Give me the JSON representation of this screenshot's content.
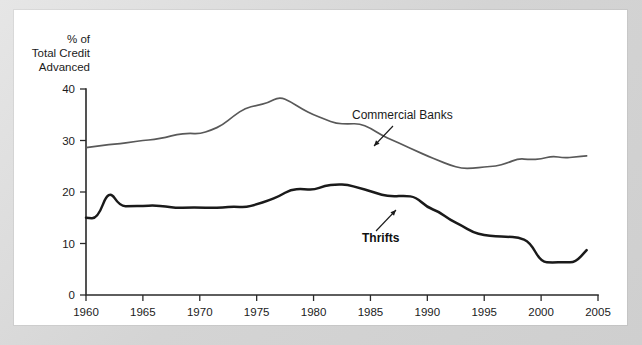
{
  "figure": {
    "background_color": "#d9d9d9",
    "panel_color": "#ffffff"
  },
  "chart_data": {
    "type": "line",
    "title": "",
    "subtitle": "",
    "xlabel": "",
    "ylabel": "% of\nTotal Credit\nAdvanced",
    "ylabel_lines": [
      "% of",
      "Total Credit",
      "Advanced"
    ],
    "xlim": [
      1960,
      2005
    ],
    "ylim": [
      0,
      40
    ],
    "grid": false,
    "legend_position": "inline-annotations",
    "yticks": [
      0,
      10,
      20,
      30,
      40
    ],
    "ytick_labels": [
      "0",
      "10",
      "20",
      "30",
      "40"
    ],
    "xticks": [
      1960,
      1965,
      1970,
      1975,
      1980,
      1985,
      1990,
      1995,
      2000,
      2005
    ],
    "xtick_labels": [
      "1960",
      "1965",
      "1970",
      "1975",
      "1980",
      "1985",
      "1990",
      "1995",
      "2000",
      "2005"
    ],
    "x": [
      1960,
      1961,
      1962,
      1963,
      1964,
      1965,
      1966,
      1967,
      1968,
      1969,
      1970,
      1971,
      1972,
      1973,
      1974,
      1975,
      1976,
      1977,
      1978,
      1979,
      1980,
      1981,
      1982,
      1983,
      1984,
      1985,
      1986,
      1987,
      1988,
      1989,
      1990,
      1991,
      1992,
      1993,
      1994,
      1995,
      1996,
      1997,
      1998,
      1999,
      2000,
      2001,
      2002,
      2003,
      2004
    ],
    "series": [
      {
        "name": "Commercial Banks",
        "color": "#595959",
        "line_width": 1.7,
        "values": [
          28.6,
          28.9,
          29.2,
          29.4,
          29.7,
          30.0,
          30.2,
          30.6,
          31.2,
          31.4,
          31.3,
          32.0,
          33.0,
          34.8,
          36.3,
          36.8,
          37.3,
          38.5,
          37.5,
          36.1,
          35.0,
          34.1,
          33.3,
          33.2,
          33.3,
          32.4,
          31.0,
          30.0,
          29.0,
          28.0,
          27.0,
          26.1,
          25.2,
          24.6,
          24.6,
          24.9,
          25.0,
          25.6,
          26.5,
          26.3,
          26.4,
          27.0,
          26.6,
          26.8,
          27.0
        ]
      },
      {
        "name": "Thrifts",
        "color": "#1a1a1a",
        "line_width": 2.5,
        "values": [
          15.0,
          14.8,
          20.5,
          17.2,
          17.3,
          17.3,
          17.4,
          17.2,
          16.9,
          17.0,
          17.0,
          16.9,
          17.0,
          17.2,
          17.0,
          17.6,
          18.3,
          19.2,
          20.5,
          20.6,
          20.4,
          21.2,
          21.5,
          21.4,
          20.8,
          20.2,
          19.4,
          19.1,
          19.3,
          19.0,
          17.0,
          16.2,
          14.6,
          13.5,
          12.2,
          11.6,
          11.4,
          11.3,
          11.2,
          10.3,
          6.4,
          6.3,
          6.4,
          6.3,
          8.7
        ]
      }
    ],
    "annotations": [
      {
        "label": "Commercial Banks",
        "bold": false,
        "text_x": 352,
        "text_y": 119,
        "arrow_from_x": 393,
        "arrow_from_y": 126,
        "arrow_to_x": 374,
        "arrow_to_y": 146
      },
      {
        "label": "Thrifts",
        "bold": true,
        "text_x": 362,
        "text_y": 242,
        "arrow_from_x": 376,
        "arrow_from_y": 231,
        "arrow_to_x": 396,
        "arrow_to_y": 210
      }
    ]
  }
}
